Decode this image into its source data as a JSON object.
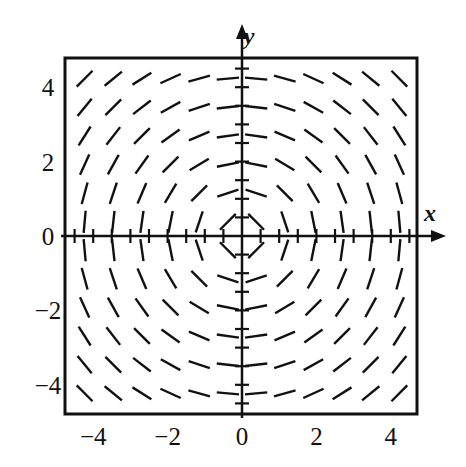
{
  "figure": {
    "kind": "slope-field",
    "background_color": "#ffffff",
    "ink_color": "#111111",
    "frame": {
      "x_min_px": 65,
      "y_min_px": 58,
      "x_max_px": 417,
      "y_max_px": 414,
      "stroke_width": 3
    }
  },
  "axes": {
    "x_axis_label": "x",
    "y_axis_label": "y",
    "x_label_pos": {
      "x": 430,
      "y": 221
    },
    "y_label_pos": {
      "x": 249,
      "y": 44
    },
    "origin_px": {
      "x": 242,
      "y": 236
    },
    "unit_px": 37.2,
    "x_arrow_end_px": 446,
    "y_arrow_end_px": 24,
    "minor_tick_step": 0.5,
    "minor_tick_half_len": 7,
    "axis_stroke_width": 2.5
  },
  "ticks": {
    "x_values": [
      -4,
      -2,
      0,
      2,
      4
    ],
    "x_labels": [
      "−4",
      "−2",
      "0",
      "2",
      "4"
    ],
    "x_label_y_px": 445,
    "y_values": [
      4,
      2,
      0,
      -2,
      -4
    ],
    "y_labels": [
      "4",
      "2",
      "0",
      "−2",
      "−4"
    ],
    "y_label_x_px": 48
  },
  "chart_data": {
    "type": "scatter",
    "title": "",
    "xlabel": "x",
    "ylabel": "y",
    "xlim": [
      -4.75,
      4.75
    ],
    "ylim": [
      -4.75,
      4.75
    ],
    "grid": false,
    "legend": "none",
    "equation": "dy/dx = -x/y",
    "segment_half_length_units": 0.3,
    "grid_x": [
      -4.23,
      -3.46,
      -2.69,
      -1.92,
      -1.15,
      -0.38,
      0.38,
      1.15,
      1.92,
      2.69,
      3.46,
      4.23
    ],
    "grid_y": [
      4.23,
      3.46,
      2.69,
      1.92,
      1.15,
      0.38,
      -0.38,
      -1.15,
      -1.92,
      -2.69,
      -3.46,
      -4.23
    ],
    "x": [
      -4.23,
      -3.46,
      -2.69,
      -1.92,
      -1.15,
      -0.38,
      0.38,
      1.15,
      1.92,
      2.69,
      3.46,
      4.23
    ],
    "y": [
      4.23,
      3.46,
      2.69,
      1.92,
      1.15,
      0.38,
      -0.38,
      -1.15,
      -1.92,
      -2.69,
      -3.46,
      -4.23
    ],
    "slope_rows": [
      {
        "y": 4.23,
        "slopes": [
          1.0,
          0.818,
          0.636,
          0.454,
          0.272,
          0.09,
          -0.09,
          -0.272,
          -0.454,
          -0.636,
          -0.818,
          -1.0
        ]
      },
      {
        "y": 3.46,
        "slopes": [
          1.223,
          1.0,
          0.777,
          0.555,
          0.332,
          0.11,
          -0.11,
          -0.332,
          -0.555,
          -0.777,
          -1.0,
          -1.223
        ]
      },
      {
        "y": 2.69,
        "slopes": [
          1.573,
          1.286,
          1.0,
          0.714,
          0.428,
          0.141,
          -0.141,
          -0.428,
          -0.714,
          -1.0,
          -1.286,
          -1.573
        ]
      },
      {
        "y": 1.92,
        "slopes": [
          2.203,
          1.802,
          1.401,
          1.0,
          0.599,
          0.198,
          -0.198,
          -0.599,
          -1.0,
          -1.401,
          -1.802,
          -2.203
        ]
      },
      {
        "y": 1.15,
        "slopes": [
          3.678,
          3.009,
          2.339,
          1.67,
          1.0,
          0.33,
          -0.33,
          -1.0,
          -1.67,
          -2.339,
          -3.009,
          -3.678
        ]
      },
      {
        "y": 0.38,
        "slopes": [
          11.13,
          9.105,
          7.079,
          5.053,
          3.026,
          1.0,
          -1.0,
          -3.026,
          -5.053,
          -7.079,
          -9.105,
          -11.13
        ]
      },
      {
        "y": -0.38,
        "slopes": [
          -11.13,
          -9.105,
          -7.079,
          -5.053,
          -3.026,
          -1.0,
          1.0,
          3.026,
          5.053,
          7.079,
          9.105,
          11.13
        ]
      },
      {
        "y": -1.15,
        "slopes": [
          -3.678,
          -3.009,
          -2.339,
          -1.67,
          -1.0,
          -0.33,
          0.33,
          1.0,
          1.67,
          2.339,
          3.009,
          3.678
        ]
      },
      {
        "y": -1.92,
        "slopes": [
          -2.203,
          -1.802,
          -1.401,
          -1.0,
          -0.599,
          -0.198,
          0.198,
          0.599,
          1.0,
          1.401,
          1.802,
          2.203
        ]
      },
      {
        "y": -2.69,
        "slopes": [
          -1.573,
          -1.286,
          -1.0,
          -0.714,
          -0.428,
          -0.141,
          0.141,
          0.428,
          0.714,
          1.0,
          1.286,
          1.573
        ]
      },
      {
        "y": -3.46,
        "slopes": [
          -1.223,
          -1.0,
          -0.777,
          -0.555,
          -0.332,
          -0.11,
          0.11,
          0.332,
          0.555,
          0.777,
          1.0,
          1.223
        ]
      },
      {
        "y": -4.23,
        "slopes": [
          -1.0,
          -0.818,
          -0.636,
          -0.454,
          -0.272,
          -0.09,
          0.09,
          0.272,
          0.454,
          0.636,
          0.818,
          1.0
        ]
      }
    ]
  }
}
